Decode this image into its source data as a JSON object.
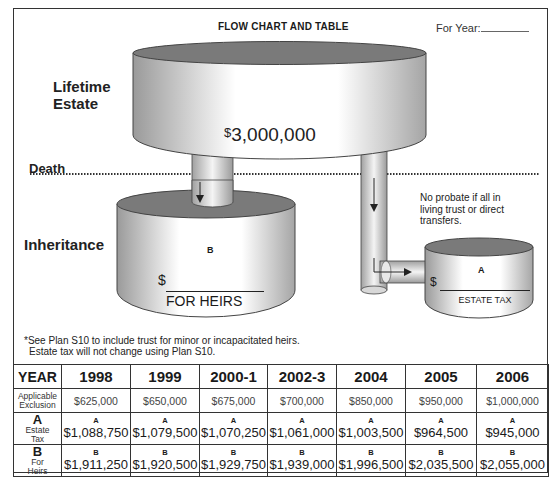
{
  "header": {
    "title": "FLOW CHART AND TABLE",
    "for_year_label": "For Year:"
  },
  "diagram": {
    "labels": {
      "lifetime_line1": "Lifetime",
      "lifetime_line2": "Estate",
      "death": "Death",
      "inheritance": "Inheritance"
    },
    "estate_amount_symbol": "$",
    "estate_amount": "3,000,000",
    "heirs_tank": {
      "letter": "B",
      "dollar": "$",
      "label": "FOR HEIRS"
    },
    "tax_tank": {
      "letter": "A",
      "dollar": "$",
      "label": "ESTATE TAX"
    },
    "note_line1": "No probate if all in",
    "note_line2": "living trust or direct",
    "note_line3": "transfers.",
    "footnote_line1": "*See Plan S10 to include trust for minor or incapacitated heirs.",
    "footnote_line2": "Estate tax will not change using Plan S10."
  },
  "colors": {
    "tank_top": "#7a7a7a",
    "tank_side_dark": "#9a9a9a",
    "tank_side_light": "#ffffff",
    "border": "#333333"
  },
  "table": {
    "year_label": "YEAR",
    "exclusion_label_line1": "Applicable",
    "exclusion_label_line2": "Exclusion",
    "a_letter": "A",
    "a_sub1": "Estate",
    "a_sub2": "Tax",
    "b_letter": "B",
    "b_sub1": "For",
    "b_sub2": "Heirs",
    "cell_letter_a": "A",
    "cell_letter_b": "B",
    "years": [
      "1998",
      "1999",
      "2000-1",
      "2002-3",
      "2004",
      "2005",
      "2006"
    ],
    "exclusion": [
      "$625,000",
      "$650,000",
      "$675,000",
      "$700,000",
      "$850,000",
      "$950,000",
      "$1,000,000"
    ],
    "estate_tax": [
      "$1,088,750",
      "$1,079,500",
      "$1,070,250",
      "$1,061,000",
      "$1,003,500",
      "$964,500",
      "$945,000"
    ],
    "for_heirs": [
      "$1,911,250",
      "$1,920,500",
      "$1,929,750",
      "$1,939,000",
      "$1,996,500",
      "$2,035,500",
      "$2,055,000"
    ]
  }
}
